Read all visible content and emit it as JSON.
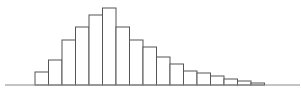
{
  "chart_data": {
    "type": "bar",
    "title": "",
    "xlabel": "",
    "ylabel": "",
    "grid": false,
    "legend": null,
    "histogram": true,
    "categories": [
      "1",
      "2",
      "3",
      "4",
      "5",
      "6",
      "7",
      "8",
      "9",
      "10",
      "11",
      "12",
      "13",
      "14",
      "15",
      "16",
      "17"
    ],
    "values": [
      13,
      25,
      45,
      58,
      70,
      77,
      58,
      45,
      38,
      28,
      21,
      14,
      12,
      9,
      6,
      4,
      2
    ],
    "ylim": [
      0,
      80
    ]
  },
  "style": {
    "bar_fill": "#ffffff",
    "bar_stroke": "#555555",
    "axis_color": "#888888"
  },
  "layout": {
    "baseline_y": 85,
    "axis_x_start": 5,
    "axis_x_end": 300,
    "first_bar_x": 35,
    "bar_width": 13.5
  }
}
